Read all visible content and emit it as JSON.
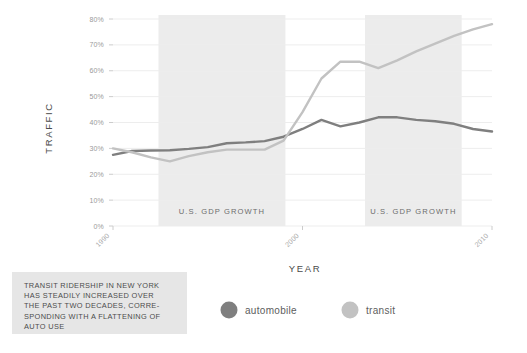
{
  "chart_data": {
    "type": "line",
    "title": "",
    "xlabel": "YEAR",
    "ylabel": "TRAFFIC",
    "xlim": [
      1990,
      2010
    ],
    "ylim": [
      0,
      80
    ],
    "grid": true,
    "legend_position": "bottom",
    "x": [
      1990,
      1991,
      1992,
      1993,
      1994,
      1995,
      1996,
      1997,
      1998,
      1999,
      2000,
      2001,
      2002,
      2003,
      2004,
      2005,
      2006,
      2007,
      2008,
      2009,
      2010
    ],
    "y_tick_labels": [
      "80%",
      "70%",
      "60%",
      "50%",
      "40%",
      "30%",
      "20%",
      "10%",
      "0%"
    ],
    "y_tick_values": [
      80,
      70,
      60,
      50,
      40,
      30,
      20,
      10,
      0
    ],
    "x_tick_labels": [
      "1990",
      "2000",
      "2010"
    ],
    "x_tick_values": [
      1990,
      2000,
      2010
    ],
    "series": [
      {
        "name": "automobile",
        "color": "#7f7f7f",
        "values": [
          27.5,
          29.0,
          29.2,
          29.3,
          29.8,
          30.5,
          32.0,
          32.3,
          32.8,
          34.5,
          37.5,
          41.0,
          38.5,
          40.0,
          42.0,
          42.0,
          41.0,
          40.5,
          39.5,
          37.5,
          36.5
        ]
      },
      {
        "name": "transit",
        "color": "#c2c2c2",
        "values": [
          30.0,
          28.5,
          26.5,
          25.0,
          27.0,
          28.5,
          29.5,
          29.5,
          29.5,
          33.0,
          44.0,
          57.0,
          63.5,
          63.5,
          61.0,
          64.0,
          67.5,
          70.5,
          73.5,
          76.0,
          78.0
        ]
      }
    ],
    "bands": [
      {
        "label": "U.S. GDP GROWTH",
        "x_start": 1992.4,
        "x_end": 1999.1,
        "color": "#ececec"
      },
      {
        "label": "U.S. GDP GROWTH",
        "x_start": 2003.3,
        "x_end": 2008.4,
        "color": "#ececec"
      }
    ]
  },
  "legend": {
    "items": [
      {
        "label": "automobile",
        "color": "#7f7f7f"
      },
      {
        "label": "transit",
        "color": "#c2c2c2"
      }
    ]
  },
  "caption": {
    "text": "TRANSIT RIDERSHIP IN NEW YORK\nHAS STEADILY INCREASED OVER\nTHE PAST TWO DECADES, CORRE-\nSPONDING WITH A FLATTENING OF\nAUTO USE",
    "background": "#e6e6e6"
  },
  "colors": {
    "automobile": "#7f7f7f",
    "transit": "#c2c2c2",
    "band": "#ececec",
    "grid": "#ededed",
    "axis_text": "#9a9a9a"
  }
}
